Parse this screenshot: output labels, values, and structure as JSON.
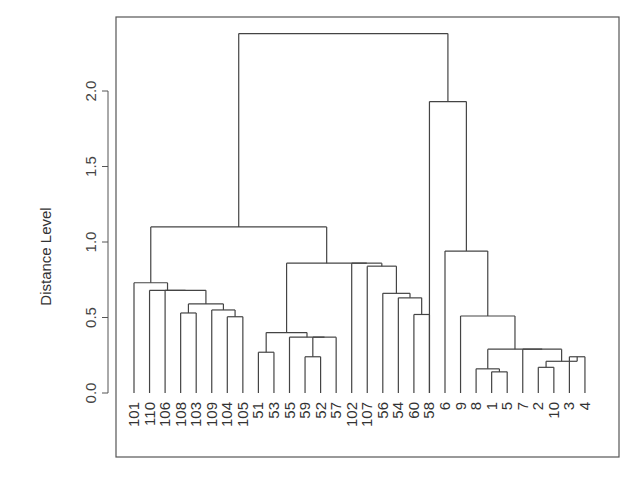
{
  "chart_data": {
    "type": "dendrogram",
    "title": "",
    "xlabel": "",
    "ylabel": "Distance Level",
    "ylim": [
      0,
      2.4
    ],
    "yticks": [
      "0.0",
      "0.5",
      "1.0",
      "1.5",
      "2.0"
    ],
    "ytick_values": [
      0.0,
      0.5,
      1.0,
      1.5,
      2.0
    ],
    "leaves": [
      "101",
      "110",
      "106",
      "108",
      "103",
      "109",
      "104",
      "105",
      "51",
      "53",
      "55",
      "59",
      "52",
      "57",
      "102",
      "107",
      "56",
      "54",
      "60",
      "58",
      "6",
      "9",
      "8",
      "1",
      "5",
      "7",
      "2",
      "10",
      "3",
      "4"
    ],
    "merges": [
      {
        "left": "1",
        "right": "5",
        "height": 0.14
      },
      {
        "left": "3",
        "right": "4",
        "height": 0.24
      },
      {
        "left": "1,5",
        "right": "8",
        "height": 0.16
      },
      {
        "left": "2",
        "right": "10",
        "height": 0.17
      },
      {
        "left": "2,10",
        "right": "3,4",
        "height": 0.21
      },
      {
        "left": "104",
        "right": "105",
        "height": 0.51
      },
      {
        "left": "51",
        "right": "53",
        "height": 0.27
      },
      {
        "left": "59",
        "right": "52",
        "height": 0.27
      },
      {
        "left": "55",
        "right": "59,52,57",
        "height": 0.24
      },
      {
        "left": "60",
        "right": "54",
        "height": 0.52
      },
      {
        "left": "108",
        "right": "103",
        "height": 0.53
      },
      {
        "left": "109",
        "right": "104,105",
        "height": 0.55
      },
      {
        "left": "108,103",
        "right": "109,104,105",
        "height": 0.59
      },
      {
        "left": "106",
        "right": "...",
        "height": 0.68
      },
      {
        "left": "101",
        "right": "110...",
        "height": 0.73
      },
      {
        "left": "56",
        "right": "54,60",
        "height": 0.64
      },
      {
        "left": "107",
        "right": "56,54,60",
        "height": 0.66
      },
      {
        "left": "102",
        "right": "107...",
        "height": 0.84
      },
      {
        "left": "51,53",
        "right": "55...",
        "height": 0.4
      },
      {
        "left": "51..57",
        "right": "102..60",
        "height": 0.86
      },
      {
        "left": "101..105",
        "right": "51..60",
        "height": 1.1
      },
      {
        "left": "6",
        "right": "9",
        "height": 0.29
      },
      {
        "left": "6,9",
        "right": "8..4",
        "height": 0.51
      },
      {
        "left": "58",
        "right": "6..4",
        "height": 0.94
      },
      {
        "left": "58..4",
        "right": "",
        "height": 1.93
      },
      {
        "left": "101..60",
        "right": "58..4",
        "height": 2.38
      }
    ]
  }
}
